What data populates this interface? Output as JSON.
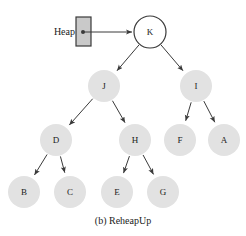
{
  "figure": {
    "caption": "(b) ReheapUp",
    "pointer_label": "Heap",
    "colors": {
      "node_fill": "#e2e2e2",
      "root_fill": "#ffffff",
      "stroke": "#3a3a3a",
      "box_fill": "#c9c9c9",
      "text": "#1a1a1a",
      "background": "#ffffff"
    }
  },
  "chart_data": {
    "type": "diagram",
    "title": "(b) ReheapUp",
    "nodes": [
      {
        "id": "K",
        "label": "K",
        "cx": 150,
        "cy": 32,
        "r": 16,
        "level": 0,
        "style": "outlined"
      },
      {
        "id": "J",
        "label": "J",
        "cx": 104,
        "cy": 86,
        "r": 16,
        "level": 1,
        "style": "filled"
      },
      {
        "id": "I",
        "label": "I",
        "cx": 196,
        "cy": 86,
        "r": 16,
        "level": 1,
        "style": "filled"
      },
      {
        "id": "D",
        "label": "D",
        "cx": 56,
        "cy": 140,
        "r": 16,
        "level": 2,
        "style": "filled"
      },
      {
        "id": "H",
        "label": "H",
        "cx": 135,
        "cy": 140,
        "r": 16,
        "level": 2,
        "style": "filled"
      },
      {
        "id": "F",
        "label": "F",
        "cx": 180,
        "cy": 140,
        "r": 16,
        "level": 2,
        "style": "filled"
      },
      {
        "id": "A",
        "label": "A",
        "cx": 224,
        "cy": 140,
        "r": 16,
        "level": 2,
        "style": "filled"
      },
      {
        "id": "B",
        "label": "B",
        "cx": 24,
        "cy": 192,
        "r": 16,
        "level": 3,
        "style": "filled"
      },
      {
        "id": "C",
        "label": "C",
        "cx": 70,
        "cy": 192,
        "r": 16,
        "level": 3,
        "style": "filled"
      },
      {
        "id": "E",
        "label": "E",
        "cx": 117,
        "cy": 192,
        "r": 16,
        "level": 3,
        "style": "filled"
      },
      {
        "id": "G",
        "label": "G",
        "cx": 163,
        "cy": 192,
        "r": 16,
        "level": 3,
        "style": "filled"
      }
    ],
    "edges": [
      {
        "from": "K",
        "to": "J"
      },
      {
        "from": "K",
        "to": "I"
      },
      {
        "from": "J",
        "to": "D"
      },
      {
        "from": "J",
        "to": "H"
      },
      {
        "from": "I",
        "to": "F"
      },
      {
        "from": "I",
        "to": "A"
      },
      {
        "from": "D",
        "to": "B"
      },
      {
        "from": "D",
        "to": "C"
      },
      {
        "from": "H",
        "to": "E"
      },
      {
        "from": "H",
        "to": "G"
      }
    ],
    "pointer": {
      "label": "Heap",
      "box": {
        "x": 76,
        "y": 17,
        "width": 15,
        "height": 29
      },
      "dot": {
        "cx": 83,
        "cy": 32,
        "r": 2
      },
      "arrow": {
        "x1": 84,
        "y1": 32,
        "x2": 132,
        "y2": 32
      },
      "target": "K"
    },
    "caption_position": {
      "x": 123,
      "y": 222
    }
  }
}
